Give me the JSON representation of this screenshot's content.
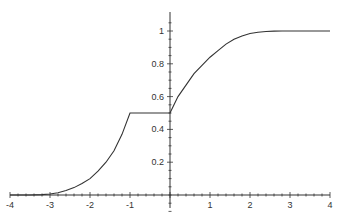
{
  "chart_data": {
    "type": "line",
    "title": "",
    "xlabel": "",
    "ylabel": "",
    "xlim": [
      -4,
      4
    ],
    "ylim": [
      0,
      1.08
    ],
    "grid": false,
    "legend": "none",
    "x_ticks": [
      -4,
      -3,
      -2,
      -1,
      1,
      2,
      3,
      4
    ],
    "x_tick_labels": [
      "-4",
      "-3",
      "-2",
      "-1",
      "1",
      "2",
      "3",
      "4"
    ],
    "y_ticks": [
      0.2,
      0.4,
      0.6,
      0.8,
      1
    ],
    "y_tick_labels": [
      "0.2",
      "0.4",
      "0.6",
      "0.8",
      "1"
    ],
    "series": [
      {
        "name": "piecewise function",
        "x": [
          -4,
          -3.5,
          -3.2,
          -3,
          -2.8,
          -2.6,
          -2.4,
          -2.2,
          -2,
          -1.8,
          -1.6,
          -1.4,
          -1.2,
          -1,
          -0.5,
          0,
          0.1,
          0.2,
          0.4,
          0.6,
          0.8,
          1,
          1.2,
          1.4,
          1.6,
          1.8,
          2,
          2.2,
          2.4,
          2.6,
          2.8,
          3,
          3.5,
          4
        ],
        "y": [
          0,
          0,
          0.002,
          0.006,
          0.014,
          0.027,
          0.045,
          0.07,
          0.1,
          0.145,
          0.2,
          0.27,
          0.37,
          0.5,
          0.5,
          0.5,
          0.55,
          0.6,
          0.67,
          0.74,
          0.79,
          0.84,
          0.88,
          0.92,
          0.95,
          0.97,
          0.985,
          0.992,
          0.997,
          0.999,
          1,
          1,
          1,
          1
        ]
      }
    ]
  }
}
